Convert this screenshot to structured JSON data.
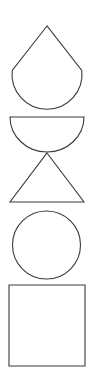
{
  "canvas": {
    "width": 94,
    "height": 389,
    "background_color": "#ffffff",
    "stroke_color": "#3a3a3a",
    "fill_color": "#ffffff",
    "stroke_width": 1.1
  },
  "figure": {
    "orientation": "vertical",
    "shape_count": 5
  },
  "shapes": [
    {
      "index": 1,
      "name": "teardrop",
      "label": "Teardrop",
      "description": "Pointed apex at top with circular lower lobe",
      "apex": {
        "x": 47,
        "y": 26
      },
      "shoulder_left": {
        "x": 12,
        "y": 70
      },
      "shoulder_right": {
        "x": 82,
        "y": 70
      },
      "bottom_y": 113,
      "width": 70,
      "height": 87,
      "path": "M 47 26 L 12.2 70.5 A 35 35 0 1 0 81.8 70.5 Z"
    },
    {
      "index": 2,
      "name": "semicircle",
      "label": "Semicircle",
      "description": "Half disc with flat edge on top, arc opening downward",
      "flat_top_y": 117,
      "left_x": 10,
      "right_x": 84,
      "bottom_y": 152,
      "width": 74,
      "height": 35,
      "path": "M 10 117 L 84 117 A 37 35 0 0 1 10 117 Z"
    },
    {
      "index": 3,
      "name": "triangle",
      "label": "Triangle",
      "description": "Isosceles triangle, apex up, flat base",
      "apex": {
        "x": 47,
        "y": 153
      },
      "base_left": {
        "x": 10,
        "y": 202
      },
      "base_right": {
        "x": 84,
        "y": 202
      },
      "width": 74,
      "height": 49,
      "path": "M 47 153 L 84 202 L 10 202 Z"
    },
    {
      "index": 4,
      "name": "circle",
      "label": "Circle",
      "center": {
        "x": 46.5,
        "y": 245
      },
      "radius": 34,
      "top_y": 210,
      "bottom_y": 280,
      "width": 68,
      "height": 70
    },
    {
      "index": 5,
      "name": "square",
      "label": "Square",
      "left_x": 9,
      "top_y": 285,
      "right_x": 85,
      "bottom_y": 366,
      "width": 76,
      "height": 81
    }
  ]
}
